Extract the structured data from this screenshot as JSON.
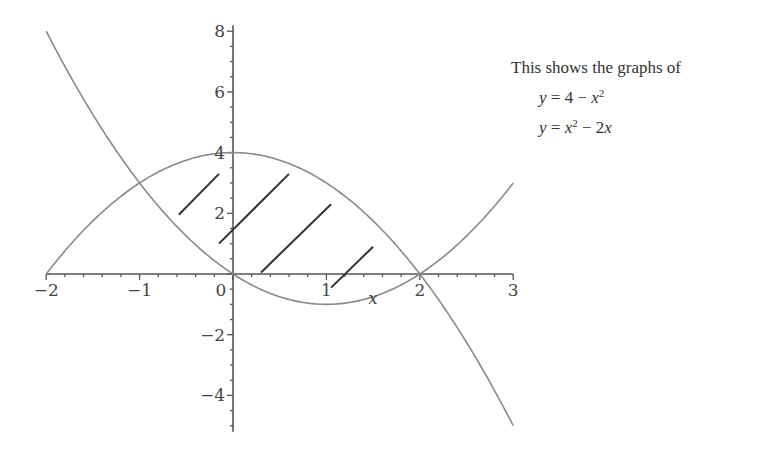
{
  "caption": {
    "intro": "This shows the graphs of",
    "equations": [
      {
        "lhs": "y",
        "rhs_parts": [
          "4 − ",
          "x",
          "2"
        ],
        "display": "y = 4 − x²"
      },
      {
        "lhs": "y",
        "rhs_parts": [
          "x",
          "2",
          " − 2",
          "x"
        ],
        "display": "y = x² − 2x"
      }
    ]
  },
  "colors": {
    "curve": "#8a8a8a",
    "axis": "#555555",
    "hatch": "#333333",
    "text": "#444444"
  },
  "chart_data": {
    "type": "line",
    "title": "",
    "xlabel": "x",
    "ylabel": "",
    "xlim": [
      -2,
      3
    ],
    "ylim": [
      -5.2,
      8.2
    ],
    "xticks": [
      -2,
      -1,
      0,
      1,
      2,
      3
    ],
    "xtick_labels": [
      "−2",
      "−1",
      "0",
      "1",
      "2",
      "3"
    ],
    "yticks": [
      8,
      6,
      4,
      2,
      -2,
      -4
    ],
    "ytick_labels": [
      "8",
      "6",
      "4",
      "2",
      "−2",
      "−4"
    ],
    "grid": false,
    "legend": null,
    "series": [
      {
        "name": "y = 4 − x^2",
        "expr": "4 - x^2",
        "x_range": [
          -2,
          3
        ],
        "x": [
          -2,
          -1.5,
          -1,
          -0.5,
          0,
          0.5,
          1,
          1.5,
          2,
          2.5,
          3
        ],
        "values": [
          0,
          1.75,
          3,
          3.75,
          4,
          3.75,
          3,
          1.75,
          0,
          -2.25,
          -5
        ]
      },
      {
        "name": "y = x^2 − 2x",
        "expr": "x^2 - 2x",
        "x_range": [
          -2,
          3
        ],
        "x": [
          -2,
          -1.5,
          -1,
          -0.5,
          0,
          0.5,
          1,
          1.5,
          2,
          2.5,
          3
        ],
        "values": [
          8,
          5.25,
          3,
          1.25,
          0,
          -0.75,
          -1,
          -0.75,
          0,
          1.25,
          3
        ]
      }
    ],
    "annotations": [
      {
        "type": "hatch",
        "description": "Diagonal hatch lines shading the region between the curves for 0 ≤ x ≤ 2 (and partially near x≈-0.5)",
        "segments": [
          {
            "x1": -0.58,
            "y1": 1.95,
            "x2": -0.15,
            "y2": 3.3
          },
          {
            "x1": -0.15,
            "y1": 1.0,
            "x2": 0.6,
            "y2": 3.3
          },
          {
            "x1": 0.3,
            "y1": 0.05,
            "x2": 1.05,
            "y2": 2.3
          },
          {
            "x1": 1.05,
            "y1": -0.45,
            "x2": 1.5,
            "y2": 0.9
          }
        ]
      }
    ],
    "intersections": [
      {
        "x": -1,
        "y": 3
      },
      {
        "x": 2,
        "y": 0
      }
    ]
  }
}
